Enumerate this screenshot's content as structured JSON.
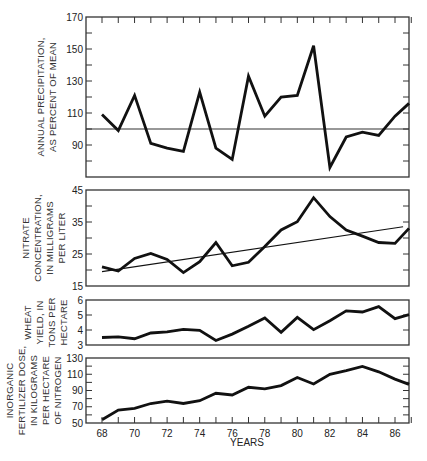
{
  "figure": {
    "x_axis_title": "YEARS",
    "x_tick_labels": [
      "68",
      "70",
      "72",
      "74",
      "76",
      "78",
      "80",
      "82",
      "84",
      "86"
    ]
  },
  "chart_data": [
    {
      "type": "line",
      "id": "precipitation",
      "ylabel_lines": [
        "ANNUAL PRECIPITATION,",
        "AS PERCENT OF MEAN"
      ],
      "xlabel": "YEARS",
      "ylim": [
        70,
        170
      ],
      "yticks_labeled": [
        170,
        150,
        130,
        110,
        90
      ],
      "yticks_minor_step": 10,
      "reference_line": 100,
      "x": [
        68,
        69,
        70,
        71,
        72,
        73,
        74,
        75,
        76,
        77,
        78,
        79,
        80,
        81,
        82,
        83,
        84,
        85,
        86,
        87
      ],
      "series": [
        {
          "name": "Annual precipitation (% of mean)",
          "values": [
            109,
            99,
            121,
            91,
            88,
            86,
            123,
            88,
            81,
            133,
            108,
            120,
            121,
            152,
            76,
            95,
            98,
            96,
            108,
            116
          ]
        }
      ]
    },
    {
      "type": "line",
      "id": "nitrate",
      "ylabel_lines": [
        "NITRATE",
        "CONCENTRATION,",
        "IN MILLIGRAMS",
        "PER LITER"
      ],
      "xlabel": "YEARS",
      "ylim": [
        15,
        45
      ],
      "yticks_labeled": [
        45,
        35,
        25,
        15
      ],
      "yticks_minor_step": 5,
      "x": [
        68,
        69,
        70,
        71,
        72,
        73,
        74,
        75,
        76,
        77,
        78,
        79,
        80,
        81,
        82,
        83,
        84,
        85,
        86,
        87
      ],
      "series": [
        {
          "name": "Nitrate concentration (mg/L)",
          "values": [
            21,
            19.7,
            23.6,
            25.2,
            23.3,
            19.2,
            22.6,
            28.6,
            21.3,
            22.4,
            27.3,
            32.5,
            35.1,
            42.6,
            36.7,
            32.5,
            30.6,
            28.6,
            28.3,
            33
          ]
        },
        {
          "name": "Trend line",
          "x": [
            68,
            86.5
          ],
          "values": [
            19.5,
            33.5
          ]
        }
      ]
    },
    {
      "type": "line",
      "id": "wheat",
      "ylabel_lines": [
        "WHEAT",
        "YIELD, IN",
        "TONS PER",
        "HECTARE"
      ],
      "xlabel": "YEARS",
      "ylim": [
        3,
        6
      ],
      "yticks_labeled": [
        6,
        5,
        4,
        3
      ],
      "yticks_minor_step": 1,
      "x": [
        68,
        69,
        70,
        71,
        72,
        73,
        74,
        75,
        76,
        77,
        78,
        79,
        80,
        81,
        82,
        83,
        84,
        85,
        86,
        87
      ],
      "series": [
        {
          "name": "Wheat yield (t/ha)",
          "values": [
            3.5,
            3.55,
            3.42,
            3.8,
            3.87,
            4.04,
            3.98,
            3.3,
            3.73,
            4.25,
            4.8,
            3.84,
            4.84,
            4.02,
            4.62,
            5.27,
            5.2,
            5.56,
            4.76,
            5.02
          ]
        }
      ]
    },
    {
      "type": "line",
      "id": "fertilizer",
      "ylabel_lines": [
        "INORGANIC",
        "FERTILIZER DOSE,",
        "IN KILOGRAMS",
        "PER HECTARE",
        "OF NITROGEN"
      ],
      "xlabel": "YEARS",
      "ylim": [
        50,
        130
      ],
      "yticks_labeled": [
        130,
        110,
        90,
        70,
        50
      ],
      "yticks_minor_step": 10,
      "x": [
        68,
        69,
        70,
        71,
        72,
        73,
        74,
        75,
        76,
        77,
        78,
        79,
        80,
        81,
        82,
        83,
        84,
        85,
        86,
        87
      ],
      "series": [
        {
          "name": "Nitrogen fertilizer dose (kg/ha)",
          "values": [
            54,
            66,
            68,
            74,
            77,
            74,
            77.5,
            86.5,
            84.5,
            94,
            92,
            96,
            106,
            98,
            110,
            114.5,
            119.5,
            113,
            104,
            97.5
          ]
        }
      ]
    }
  ]
}
